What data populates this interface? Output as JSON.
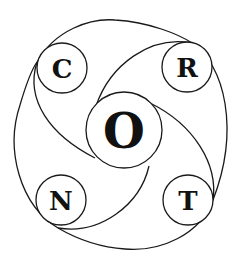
{
  "diagram": {
    "type": "spiral-circle-diagram",
    "colors": {
      "background": "#ffffff",
      "stroke": "#1a1a1a",
      "text": "#111111"
    },
    "center": {
      "label": "O",
      "cx": 124,
      "cy": 130,
      "r": 38
    },
    "nodes": [
      {
        "label": "C",
        "cx": 62,
        "cy": 68,
        "r": 25,
        "position": "top-left"
      },
      {
        "label": "R",
        "cx": 187,
        "cy": 67,
        "r": 25,
        "position": "top-right"
      },
      {
        "label": "N",
        "cx": 61,
        "cy": 200,
        "r": 25,
        "position": "bottom-left"
      },
      {
        "label": "T",
        "cx": 188,
        "cy": 200,
        "r": 25,
        "position": "bottom-right"
      }
    ],
    "word": "CRONT"
  }
}
